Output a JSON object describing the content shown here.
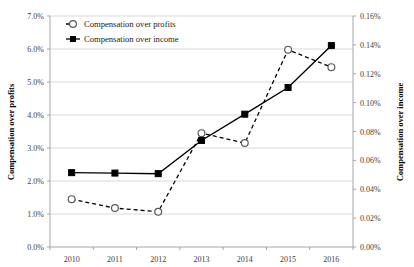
{
  "chart_data": {
    "type": "line",
    "title": "",
    "categories": [
      "2010",
      "2011",
      "2012",
      "2013",
      "2014",
      "2015",
      "2016"
    ],
    "x": [
      2010,
      2011,
      2012,
      2013,
      2014,
      2015,
      2016
    ],
    "series": [
      {
        "name": "Compensation over profits",
        "axis": "left",
        "marker": "open-circle",
        "line_style": "dashed",
        "color": "#000000",
        "values": [
          1.45,
          1.18,
          1.07,
          3.45,
          3.15,
          5.98,
          5.45
        ],
        "value_labels": [
          "1.45%",
          "1.18%",
          "1.07%",
          "3.45%",
          "3.15%",
          "5.98%",
          "5.45%"
        ]
      },
      {
        "name": "Compensation over income",
        "axis": "right",
        "marker": "filled-square",
        "line_style": "solid",
        "color": "#000000",
        "values": [
          0.0515,
          0.0512,
          0.0508,
          0.0738,
          0.092,
          0.1105,
          0.1395
        ],
        "value_labels": [
          "0.052%",
          "0.051%",
          "0.051%",
          "0.074%",
          "0.092%",
          "0.110%",
          "0.140%"
        ]
      }
    ],
    "xlabel": "",
    "ylabel": "Compensation over profits",
    "y2label": "Compensation over income",
    "ylim": [
      0,
      7
    ],
    "y2lim": [
      0,
      0.16
    ],
    "yticks": [
      "0.0%",
      "1.0%",
      "2.0%",
      "3.0%",
      "4.0%",
      "5.0%",
      "6.0%",
      "7.0%"
    ],
    "ytick_values": [
      0,
      1,
      2,
      3,
      4,
      5,
      6,
      7
    ],
    "y2ticks": [
      "0.00%",
      "0.02%",
      "0.04%",
      "0.06%",
      "0.08%",
      "0.10%",
      "0.12%",
      "0.14%",
      "0.16%"
    ],
    "y2tick_values": [
      0,
      0.02,
      0.04,
      0.06,
      0.08,
      0.1,
      0.12,
      0.14,
      0.16
    ],
    "grid": "horizontal",
    "gridline_color": "#d9d9d9",
    "legend_position": "top-left",
    "legend": [
      {
        "label": "Compensation over profits",
        "marker": "open-circle",
        "line_style": "dashed"
      },
      {
        "label": "Compensation over income",
        "marker": "filled-square",
        "line_style": "solid"
      }
    ]
  },
  "axes": {
    "left_title": "Compensation over profits",
    "right_title": "Compensation over income"
  }
}
